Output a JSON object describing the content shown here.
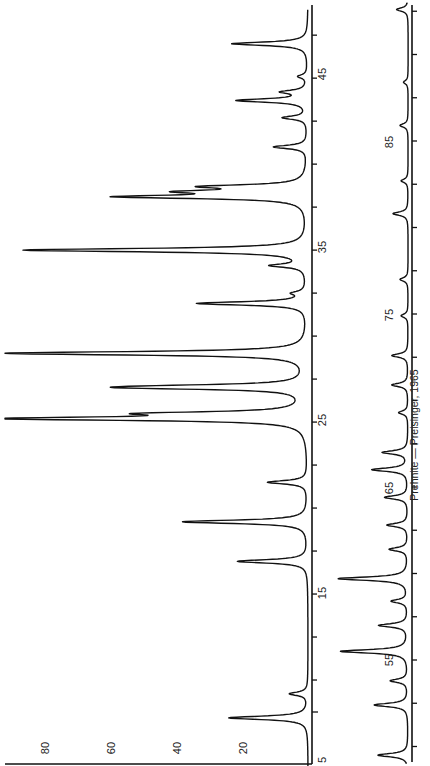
{
  "chart_data": {
    "type": "line",
    "title": "Prehnite — Preisinger, 1965",
    "orientation": "rotated 90° counter-clockwise (2θ runs bottom-to-top, intensity runs right-to-left)",
    "xlabel": "2θ (degrees)",
    "ylabel": "Relative intensity",
    "intensity_ticks": [
      "20",
      "40",
      "60",
      "80"
    ],
    "ylim": [
      0,
      100
    ],
    "panels": [
      {
        "name": "upper-trace",
        "xlim": [
          5,
          49
        ],
        "x_tick_labels": [
          "5",
          "15",
          "25",
          "35",
          "45"
        ],
        "peaks": [
          {
            "two_theta": 7.8,
            "intensity": 26
          },
          {
            "two_theta": 9.2,
            "intensity": 6
          },
          {
            "two_theta": 16.9,
            "intensity": 23
          },
          {
            "two_theta": 19.2,
            "intensity": 41
          },
          {
            "two_theta": 21.5,
            "intensity": 13
          },
          {
            "two_theta": 25.2,
            "intensity": 98
          },
          {
            "two_theta": 25.5,
            "intensity": 44
          },
          {
            "two_theta": 27.0,
            "intensity": 47
          },
          {
            "two_theta": 27.1,
            "intensity": 26
          },
          {
            "two_theta": 29.0,
            "intensity": 100
          },
          {
            "two_theta": 31.9,
            "intensity": 36
          },
          {
            "two_theta": 32.5,
            "intensity": 4
          },
          {
            "two_theta": 34.1,
            "intensity": 11
          },
          {
            "two_theta": 35.0,
            "intensity": 93
          },
          {
            "two_theta": 38.1,
            "intensity": 59
          },
          {
            "two_theta": 38.4,
            "intensity": 33
          },
          {
            "two_theta": 38.7,
            "intensity": 30
          },
          {
            "two_theta": 41.0,
            "intensity": 11
          },
          {
            "two_theta": 42.7,
            "intensity": 8
          },
          {
            "two_theta": 43.7,
            "intensity": 23
          },
          {
            "two_theta": 44.2,
            "intensity": 8
          },
          {
            "two_theta": 45.1,
            "intensity": 3
          },
          {
            "two_theta": 47.0,
            "intensity": 25
          }
        ]
      },
      {
        "name": "lower-trace",
        "xlim": [
          49,
          93
        ],
        "x_tick_labels": [
          "55",
          "65",
          "75",
          "85"
        ],
        "peaks": [
          {
            "two_theta": 49.5,
            "intensity": 26
          },
          {
            "two_theta": 52.4,
            "intensity": 29
          },
          {
            "two_theta": 53.8,
            "intensity": 15
          },
          {
            "two_theta": 55.5,
            "intensity": 58
          },
          {
            "two_theta": 57.0,
            "intensity": 25
          },
          {
            "two_theta": 58.4,
            "intensity": 14
          },
          {
            "two_theta": 59.7,
            "intensity": 60
          },
          {
            "two_theta": 61.4,
            "intensity": 16
          },
          {
            "two_theta": 62.8,
            "intensity": 18
          },
          {
            "two_theta": 64.4,
            "intensity": 20
          },
          {
            "two_theta": 66.0,
            "intensity": 31
          },
          {
            "two_theta": 67.0,
            "intensity": 22
          },
          {
            "two_theta": 69.3,
            "intensity": 8
          },
          {
            "two_theta": 70.9,
            "intensity": 14
          },
          {
            "two_theta": 72.6,
            "intensity": 14
          },
          {
            "two_theta": 74.9,
            "intensity": 6
          },
          {
            "two_theta": 77.0,
            "intensity": 7
          },
          {
            "two_theta": 80.8,
            "intensity": 13
          },
          {
            "two_theta": 82.7,
            "intensity": 6
          },
          {
            "two_theta": 85.9,
            "intensity": 7
          },
          {
            "two_theta": 88.4,
            "intensity": 4
          },
          {
            "two_theta": 92.6,
            "intensity": 10
          }
        ]
      }
    ],
    "grid": false,
    "legend": null
  },
  "labels": {
    "caption": "Prehnite — Preisinger, 1965",
    "int_20": "20",
    "int_40": "40",
    "int_60": "60",
    "int_80": "80",
    "tt_5": "5",
    "tt_15": "15",
    "tt_25": "25",
    "tt_35": "35",
    "tt_45": "45",
    "tt_55": "55",
    "tt_65": "65",
    "tt_75": "75",
    "tt_85": "85"
  }
}
